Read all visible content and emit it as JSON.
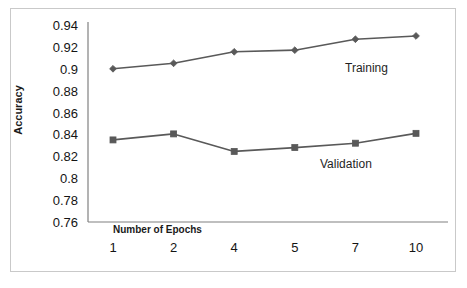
{
  "chart_data": {
    "type": "line",
    "title": "",
    "xlabel": "Number  of Epochs",
    "ylabel": "Accuracy",
    "x": [
      1,
      2,
      4,
      5,
      7,
      10
    ],
    "categories": [
      "1",
      "2",
      "4",
      "5",
      "7",
      "10"
    ],
    "xtick_labels": [
      "1",
      "2",
      "4",
      "5",
      "7",
      "10"
    ],
    "ytick_labels": [
      "0.94",
      "0.92",
      "0.9",
      "0.88",
      "0.86",
      "0.84",
      "0.82",
      "0.8",
      "0.78",
      "0.76"
    ],
    "ytick_values": [
      0.94,
      0.92,
      0.9,
      0.88,
      0.86,
      0.84,
      0.82,
      0.8,
      0.78,
      0.76
    ],
    "ylim": [
      0.76,
      0.94
    ],
    "grid": false,
    "legend_position": "inline-annotation",
    "series": [
      {
        "name": "Training",
        "values": [
          0.9,
          0.905,
          0.9155,
          0.917,
          0.927,
          0.93
        ],
        "marker": "diamond",
        "color": "#595959"
      },
      {
        "name": "Validation",
        "values": [
          0.835,
          0.8405,
          0.8245,
          0.828,
          0.832,
          0.841
        ],
        "marker": "square",
        "color": "#595959"
      }
    ],
    "annotations": [
      {
        "text": "Training",
        "series": "Training"
      },
      {
        "text": "Validation",
        "series": "Validation"
      }
    ]
  },
  "colors": {
    "line": "#595959",
    "axis": "#808080",
    "frame": "#c9c9c9",
    "text": "#141414",
    "background": "#ffffff"
  }
}
